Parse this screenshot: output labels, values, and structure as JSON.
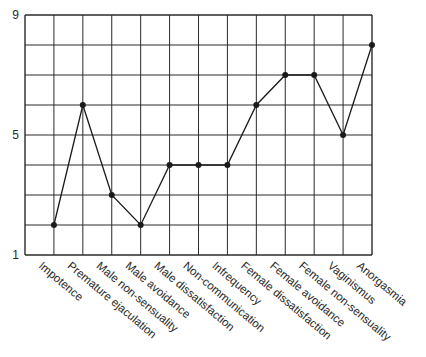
{
  "chart_data": {
    "type": "line",
    "title": "",
    "xlabel": "",
    "ylabel": "",
    "categories": [
      "Impotence",
      "Premature ejaculation",
      "Male non-sensuality",
      "Male avoidance",
      "Male dissatisfaction",
      "Non-communication",
      "Infrequency",
      "Female dissatisfaction",
      "Female avoidance",
      "Female non-sensuality",
      "Vaginismus",
      "Anorgasmia"
    ],
    "values": [
      2,
      6,
      3,
      2,
      4,
      4,
      4,
      6,
      7,
      7,
      5,
      8
    ],
    "ylim": [
      1,
      9
    ],
    "yticks": [
      1,
      5,
      9
    ],
    "grid": true,
    "legend": null
  },
  "colors": {
    "line": "#1a1a1a",
    "grid": "#2a2a2a",
    "text": "#2a2a2a"
  }
}
